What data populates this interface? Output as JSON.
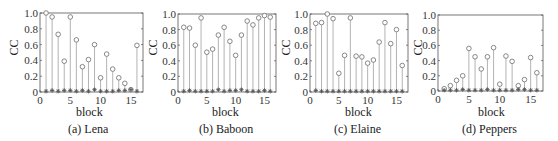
{
  "figure": {
    "panels": [
      {
        "id": "a",
        "caption": "(a) Lena",
        "xlabel": "block",
        "ylabel": "CC"
      },
      {
        "id": "b",
        "caption": "(b) Baboon",
        "xlabel": "block",
        "ylabel": "CC"
      },
      {
        "id": "c",
        "caption": "(c) Elaine",
        "xlabel": "block",
        "ylabel": "CC"
      },
      {
        "id": "d",
        "caption": "(d) Peppers",
        "xlabel": "block",
        "ylabel": "CC"
      }
    ]
  },
  "chart_data": [
    {
      "type": "stem",
      "title": "(a) Lena",
      "xlabel": "block",
      "ylabel": "CC",
      "xlim": [
        0,
        17
      ],
      "ylim": [
        0,
        1.0
      ],
      "xticks": [
        0,
        5,
        10,
        15
      ],
      "yticks": [
        0,
        0.2,
        0.4,
        0.6,
        0.8,
        1.0
      ],
      "x": [
        1,
        2,
        3,
        4,
        5,
        6,
        7,
        8,
        9,
        10,
        11,
        12,
        13,
        14,
        15,
        16
      ],
      "series": [
        {
          "name": "circle-markers",
          "marker": "o",
          "values": [
            1.0,
            0.95,
            0.73,
            0.39,
            0.95,
            0.66,
            0.32,
            0.41,
            0.6,
            0.18,
            0.48,
            0.29,
            0.18,
            0.11,
            0.03,
            0.59
          ]
        },
        {
          "name": "star-markers",
          "marker": "*",
          "values": [
            0.01,
            0.02,
            0.01,
            0.02,
            0.02,
            0.01,
            0.02,
            0.01,
            0.03,
            0.01,
            0.01,
            0.01,
            0.02,
            0.02,
            0.03,
            0.01
          ]
        }
      ]
    },
    {
      "type": "stem",
      "title": "(b) Baboon",
      "xlabel": "block",
      "ylabel": "CC",
      "xlim": [
        0,
        17
      ],
      "ylim": [
        0,
        1.0
      ],
      "xticks": [
        0,
        5,
        10,
        15
      ],
      "yticks": [
        0,
        0.2,
        0.4,
        0.6,
        0.8,
        1.0
      ],
      "x": [
        1,
        2,
        3,
        4,
        5,
        6,
        7,
        8,
        9,
        10,
        11,
        12,
        13,
        14,
        15,
        16
      ],
      "series": [
        {
          "name": "circle-markers",
          "marker": "o",
          "values": [
            0.83,
            0.82,
            0.6,
            0.95,
            0.51,
            0.55,
            0.73,
            0.83,
            0.65,
            0.47,
            0.73,
            0.91,
            0.86,
            0.95,
            0.98,
            0.96
          ]
        },
        {
          "name": "star-markers",
          "marker": "*",
          "values": [
            0.01,
            0.02,
            0.01,
            0.01,
            0.01,
            0.01,
            0.03,
            0.01,
            0.02,
            0.02,
            0.03,
            0.01,
            0.01,
            0.01,
            0.02,
            0.01
          ]
        }
      ]
    },
    {
      "type": "stem",
      "title": "(c) Elaine",
      "xlabel": "block",
      "ylabel": "CC",
      "xlim": [
        0,
        17
      ],
      "ylim": [
        0,
        1.0
      ],
      "xticks": [
        0,
        5,
        10,
        15
      ],
      "yticks": [
        0,
        0.2,
        0.4,
        0.6,
        0.8,
        1.0
      ],
      "x": [
        1,
        2,
        3,
        4,
        5,
        6,
        7,
        8,
        9,
        10,
        11,
        12,
        13,
        14,
        15,
        16
      ],
      "series": [
        {
          "name": "circle-markers",
          "marker": "o",
          "values": [
            0.88,
            0.89,
            1.0,
            0.94,
            0.24,
            0.47,
            0.95,
            0.46,
            0.45,
            0.37,
            0.41,
            0.64,
            0.89,
            0.62,
            0.8,
            0.34
          ]
        },
        {
          "name": "star-markers",
          "marker": "*",
          "values": [
            0.02,
            0.01,
            0.01,
            0.01,
            0.01,
            0.01,
            0.01,
            0.01,
            0.01,
            0.01,
            0.01,
            0.01,
            0.01,
            0.01,
            0.01,
            0.01
          ]
        }
      ]
    },
    {
      "type": "stem",
      "title": "(d) Peppers",
      "xlabel": "block",
      "ylabel": "CC",
      "xlim": [
        0,
        17
      ],
      "ylim": [
        0,
        1.0
      ],
      "xticks": [
        0,
        5,
        10,
        15
      ],
      "yticks": [
        0,
        0.2,
        0.4,
        0.6,
        0.8,
        1.0
      ],
      "x": [
        1,
        2,
        3,
        4,
        5,
        6,
        7,
        8,
        9,
        10,
        11,
        12,
        13,
        14,
        15,
        16
      ],
      "series": [
        {
          "name": "circle-markers",
          "marker": "o",
          "values": [
            0.03,
            0.07,
            0.14,
            0.2,
            0.56,
            0.45,
            0.29,
            0.45,
            0.57,
            0.09,
            0.46,
            0.39,
            0.07,
            0.15,
            0.44,
            0.24
          ]
        },
        {
          "name": "star-markers",
          "marker": "*",
          "values": [
            0.01,
            0.01,
            0.01,
            0.02,
            0.01,
            0.01,
            0.01,
            0.02,
            0.01,
            0.01,
            0.01,
            0.01,
            0.02,
            0.02,
            0.01,
            0.01
          ]
        }
      ]
    }
  ],
  "style": {
    "stem_color": "#a0a0a0",
    "circle_color": "#7a7a7a",
    "star_color": "#555555",
    "axis_color": "#555555"
  }
}
